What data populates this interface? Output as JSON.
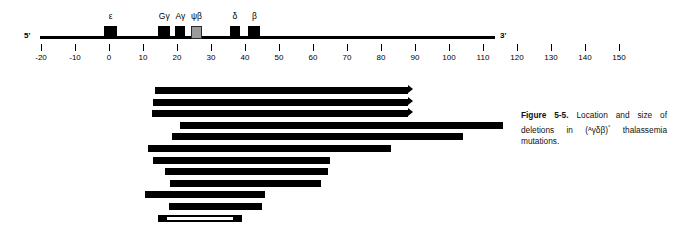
{
  "figure": {
    "number": "Figure 5-5.",
    "caption_text": " Location and size of deletions in (",
    "caption_notation_pre": "ᴬγδβ",
    "caption_notation_post": ")",
    "caption_degree": "°",
    "caption_tail": " thalassemia mutations."
  },
  "gene_map": {
    "five_prime_label": "5'",
    "three_prime_label": "3'",
    "axis_unit_min": -20,
    "axis_unit_max": 150,
    "genes": [
      {
        "name": "ε",
        "label": "ε",
        "start_kb": -1.5,
        "end_kb": 2.5,
        "fill": "black"
      },
      {
        "name": "Gγ",
        "label": "Gγ",
        "start_kb": 14.5,
        "end_kb": 18.0,
        "fill": "black"
      },
      {
        "name": "Aγ",
        "label": "Aγ",
        "start_kb": 19.5,
        "end_kb": 22.5,
        "fill": "black"
      },
      {
        "name": "ψβ",
        "label": "ψβ",
        "start_kb": 24.0,
        "end_kb": 27.5,
        "fill": "gray"
      },
      {
        "name": "δ",
        "label": "δ",
        "start_kb": 35.5,
        "end_kb": 38.5,
        "fill": "black"
      },
      {
        "name": "β",
        "label": "β",
        "start_kb": 41.0,
        "end_kb": 44.5,
        "fill": "black"
      }
    ],
    "ticks": [
      {
        "value": -20,
        "label": "-20"
      },
      {
        "value": -10,
        "label": "-10"
      },
      {
        "value": 0,
        "label": "0"
      },
      {
        "value": 10,
        "label": "10"
      },
      {
        "value": 20,
        "label": "20"
      },
      {
        "value": 30,
        "label": "30"
      },
      {
        "value": 40,
        "label": "40"
      },
      {
        "value": 50,
        "label": "50"
      },
      {
        "value": 60,
        "label": "60"
      },
      {
        "value": 70,
        "label": "70"
      },
      {
        "value": 80,
        "label": "80"
      },
      {
        "value": 90,
        "label": "90"
      },
      {
        "value": 100,
        "label": "100"
      },
      {
        "value": 110,
        "label": "110"
      },
      {
        "value": 120,
        "label": "120"
      },
      {
        "value": 130,
        "label": "130"
      },
      {
        "value": 140,
        "label": "140"
      },
      {
        "value": 150,
        "label": "150"
      }
    ]
  },
  "chart_data": {
    "type": "bar",
    "title": "Location and size of deletions in (ᴬγδβ)° thalassemia mutations",
    "xlabel": "kilobases",
    "ylabel": "",
    "xlim": [
      -20,
      150
    ],
    "orientation": "horizontal-range",
    "categories": [
      "1. Cantonese",
      "2. Malay-1",
      "3. Malay-2",
      "4. Chinese",
      "5. Yunnanese",
      "6. Thai",
      "7. German",
      "8. Belgian",
      "9. Italian",
      "10. Turkish",
      "11. Black",
      "12. Indian"
    ],
    "deletions": [
      {
        "index": 1,
        "name": "1. Cantonese",
        "start_kb": 13.5,
        "end_kb": 88.0,
        "open_end": true,
        "style": "solid"
      },
      {
        "index": 2,
        "name": "2. Malay-1",
        "start_kb": 13.0,
        "end_kb": 88.0,
        "open_end": true,
        "style": "solid"
      },
      {
        "index": 3,
        "name": "3. Malay-2",
        "start_kb": 12.5,
        "end_kb": 88.0,
        "open_end": true,
        "style": "solid"
      },
      {
        "index": 4,
        "name": "4. Chinese",
        "start_kb": 21.0,
        "end_kb": 116.0,
        "open_end": false,
        "style": "solid"
      },
      {
        "index": 5,
        "name": "5. Yunnanese",
        "start_kb": 18.5,
        "end_kb": 104.0,
        "open_end": false,
        "style": "solid"
      },
      {
        "index": 6,
        "name": "6. Thai",
        "start_kb": 11.5,
        "end_kb": 83.0,
        "open_end": false,
        "style": "solid"
      },
      {
        "index": 7,
        "name": "7. German",
        "start_kb": 13.0,
        "end_kb": 65.0,
        "open_end": false,
        "style": "solid"
      },
      {
        "index": 8,
        "name": "8. Belgian",
        "start_kb": 16.5,
        "end_kb": 64.5,
        "open_end": false,
        "style": "solid"
      },
      {
        "index": 9,
        "name": "9. Italian",
        "start_kb": 18.0,
        "end_kb": 62.5,
        "open_end": false,
        "style": "solid"
      },
      {
        "index": 10,
        "name": "10. Turkish",
        "start_kb": 10.5,
        "end_kb": 46.0,
        "open_end": false,
        "style": "solid"
      },
      {
        "index": 11,
        "name": "11. Black",
        "start_kb": 17.5,
        "end_kb": 45.0,
        "open_end": false,
        "style": "solid"
      },
      {
        "index": 12,
        "name": "12. Indian",
        "start_kb": 14.5,
        "end_kb": 39.0,
        "open_end": false,
        "style": "hollow"
      }
    ],
    "legend": [],
    "grid": false
  },
  "colors": {
    "bar": "#000000",
    "pseudo_gene": "#9a9a9a",
    "background": "#ffffff"
  }
}
